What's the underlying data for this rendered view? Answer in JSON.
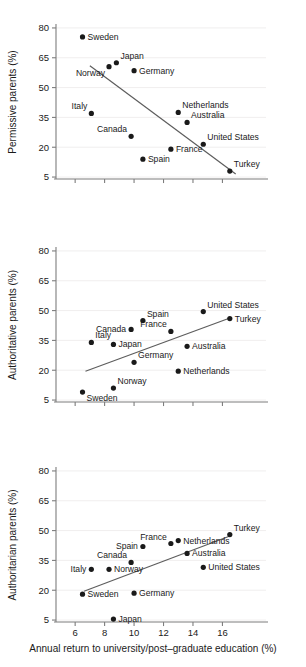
{
  "figure": {
    "xlabel": "Annual return to university/post–graduate education (%)",
    "xticks": [
      6,
      8,
      10,
      12,
      14,
      16
    ],
    "yticks": [
      5,
      20,
      35,
      50,
      65,
      80
    ],
    "xlim": [
      4.7,
      17.6
    ],
    "ylim": [
      0.5,
      85
    ],
    "panel_titles": [
      "Permissive parents (%)",
      "Authoritative parents (%)",
      "Authoritarian parents (%)"
    ]
  },
  "chart_data": [
    {
      "type": "scatter",
      "title": "",
      "xlabel": "",
      "ylabel": "Permissive parents (%)",
      "xlim": [
        4.7,
        17.6
      ],
      "ylim": [
        0.5,
        85
      ],
      "xticks": [
        6,
        8,
        10,
        12,
        14,
        16
      ],
      "yticks": [
        5,
        20,
        35,
        50,
        65,
        80
      ],
      "grid": true,
      "legend": "none",
      "points": [
        {
          "label": "Sweden",
          "x": 6.5,
          "y": 75.5,
          "label_pos": "right"
        },
        {
          "label": "Japan",
          "x": 8.8,
          "y": 62.5,
          "label_pos": "above-right"
        },
        {
          "label": "Norway",
          "x": 8.3,
          "y": 60.5,
          "label_pos": "below-left"
        },
        {
          "label": "Germany",
          "x": 10.0,
          "y": 58.5,
          "label_pos": "right"
        },
        {
          "label": "Italy",
          "x": 7.1,
          "y": 37.0,
          "label_pos": "above-left"
        },
        {
          "label": "Netherlands",
          "x": 13.0,
          "y": 37.5,
          "label_pos": "above-right"
        },
        {
          "label": "Australia",
          "x": 13.6,
          "y": 32.5,
          "label_pos": "above-right"
        },
        {
          "label": "Canada",
          "x": 9.8,
          "y": 25.5,
          "label_pos": "above-left"
        },
        {
          "label": "United States",
          "x": 14.7,
          "y": 21.5,
          "label_pos": "above-right"
        },
        {
          "label": "France",
          "x": 12.5,
          "y": 19.0,
          "label_pos": "right"
        },
        {
          "label": "Spain",
          "x": 10.6,
          "y": 14.0,
          "label_pos": "right"
        },
        {
          "label": "Turkey",
          "x": 16.5,
          "y": 8.0,
          "label_pos": "above-right"
        }
      ],
      "fit_line": {
        "x1": 7.0,
        "y1": 61.0,
        "x2": 16.9,
        "y2": 6.5
      }
    },
    {
      "type": "scatter",
      "title": "",
      "xlabel": "",
      "ylabel": "Authoritative parents (%)",
      "xlim": [
        4.7,
        17.6
      ],
      "ylim": [
        0.5,
        85
      ],
      "xticks": [
        6,
        8,
        10,
        12,
        14,
        16
      ],
      "yticks": [
        5,
        20,
        35,
        50,
        65,
        80
      ],
      "grid": true,
      "legend": "none",
      "points": [
        {
          "label": "United States",
          "x": 14.7,
          "y": 49.5,
          "label_pos": "above-right"
        },
        {
          "label": "Turkey",
          "x": 16.5,
          "y": 46.0,
          "label_pos": "right"
        },
        {
          "label": "Spain",
          "x": 10.6,
          "y": 45.0,
          "label_pos": "above-right"
        },
        {
          "label": "Canada",
          "x": 9.8,
          "y": 40.5,
          "label_pos": "left"
        },
        {
          "label": "France",
          "x": 12.5,
          "y": 39.5,
          "label_pos": "above-left"
        },
        {
          "label": "Italy",
          "x": 7.1,
          "y": 34.0,
          "label_pos": "above-right"
        },
        {
          "label": "Japan",
          "x": 8.6,
          "y": 33.0,
          "label_pos": "right"
        },
        {
          "label": "Australia",
          "x": 13.6,
          "y": 32.0,
          "label_pos": "right"
        },
        {
          "label": "Germany",
          "x": 10.0,
          "y": 24.0,
          "label_pos": "above-right"
        },
        {
          "label": "Netherlands",
          "x": 13.0,
          "y": 19.5,
          "label_pos": "right"
        },
        {
          "label": "Norway",
          "x": 8.6,
          "y": 11.0,
          "label_pos": "above-right"
        },
        {
          "label": "Sweden",
          "x": 6.5,
          "y": 9.0,
          "label_pos": "below-right"
        }
      ],
      "fit_line": {
        "x1": 6.7,
        "y1": 19.5,
        "x2": 16.6,
        "y2": 46.5
      }
    },
    {
      "type": "scatter",
      "title": "",
      "xlabel": "Annual return to university/post–graduate education (%)",
      "ylabel": "Authoritarian parents (%)",
      "xlim": [
        4.7,
        17.6
      ],
      "ylim": [
        0.5,
        85
      ],
      "xticks": [
        6,
        8,
        10,
        12,
        14,
        16
      ],
      "yticks": [
        5,
        20,
        35,
        50,
        65,
        80
      ],
      "grid": true,
      "legend": "none",
      "points": [
        {
          "label": "Turkey",
          "x": 16.5,
          "y": 48.0,
          "label_pos": "above-right"
        },
        {
          "label": "Netherlands",
          "x": 13.0,
          "y": 45.0,
          "label_pos": "right"
        },
        {
          "label": "France",
          "x": 12.5,
          "y": 43.5,
          "label_pos": "above-left"
        },
        {
          "label": "Spain",
          "x": 10.6,
          "y": 42.0,
          "label_pos": "left"
        },
        {
          "label": "Australia",
          "x": 13.6,
          "y": 38.5,
          "label_pos": "right"
        },
        {
          "label": "Canada",
          "x": 9.8,
          "y": 34.0,
          "label_pos": "above-left"
        },
        {
          "label": "United States",
          "x": 14.7,
          "y": 31.5,
          "label_pos": "right"
        },
        {
          "label": "Norway",
          "x": 8.3,
          "y": 30.5,
          "label_pos": "right"
        },
        {
          "label": "Italy",
          "x": 7.1,
          "y": 30.5,
          "label_pos": "left"
        },
        {
          "label": "Germany",
          "x": 10.0,
          "y": 18.5,
          "label_pos": "right"
        },
        {
          "label": "Sweden",
          "x": 6.5,
          "y": 18.0,
          "label_pos": "right"
        },
        {
          "label": "Japan",
          "x": 8.6,
          "y": 5.5,
          "label_pos": "right"
        }
      ],
      "fit_line": {
        "x1": 6.6,
        "y1": 19.5,
        "x2": 16.6,
        "y2": 47.5
      }
    }
  ]
}
